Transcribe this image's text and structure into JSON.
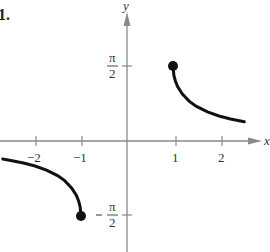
{
  "problem_number": "1.",
  "chart_data": {
    "type": "line",
    "title": "",
    "xlabel": "x",
    "ylabel": "y",
    "xlim": [
      -2.8,
      3.0
    ],
    "ylim": [
      -2.4,
      2.7
    ],
    "grid": false,
    "x_ticks": [
      {
        "value": -2,
        "label": "−2"
      },
      {
        "value": -1,
        "label": "−1"
      },
      {
        "value": 1,
        "label": "1"
      },
      {
        "value": 2,
        "label": "2"
      }
    ],
    "y_ticks": [
      {
        "value": 1.5708,
        "label_num": "π",
        "label_den": "2",
        "label": "π/2"
      },
      {
        "value": -1.5708,
        "label_num": "π",
        "label_den": "2",
        "label": "−π/2"
      }
    ],
    "series": [
      {
        "name": "right branch",
        "x": [
          1.0,
          1.02,
          1.05,
          1.1,
          1.2,
          1.35,
          1.5,
          1.75,
          2.0,
          2.25,
          2.55
        ],
        "y": [
          1.5708,
          1.3724,
          1.261,
          1.1411,
          0.9851,
          0.8338,
          0.7297,
          0.6082,
          0.5236,
          0.4606,
          0.4025
        ]
      },
      {
        "name": "left branch",
        "x": [
          -2.7,
          -2.5,
          -2.25,
          -2.0,
          -1.75,
          -1.5,
          -1.35,
          -1.2,
          -1.1,
          -1.05,
          -1.02,
          -1.0
        ],
        "y": [
          -0.3792,
          -0.4115,
          -0.4606,
          -0.5236,
          -0.6082,
          -0.7297,
          -0.8338,
          -0.9851,
          -1.1411,
          -1.261,
          -1.3724,
          -1.5708
        ]
      }
    ],
    "points": [
      {
        "x": 1,
        "y": 1.5708,
        "style": "closed"
      },
      {
        "x": -1,
        "y": -1.5708,
        "style": "closed"
      }
    ],
    "function": "y = arccsc(x)"
  }
}
